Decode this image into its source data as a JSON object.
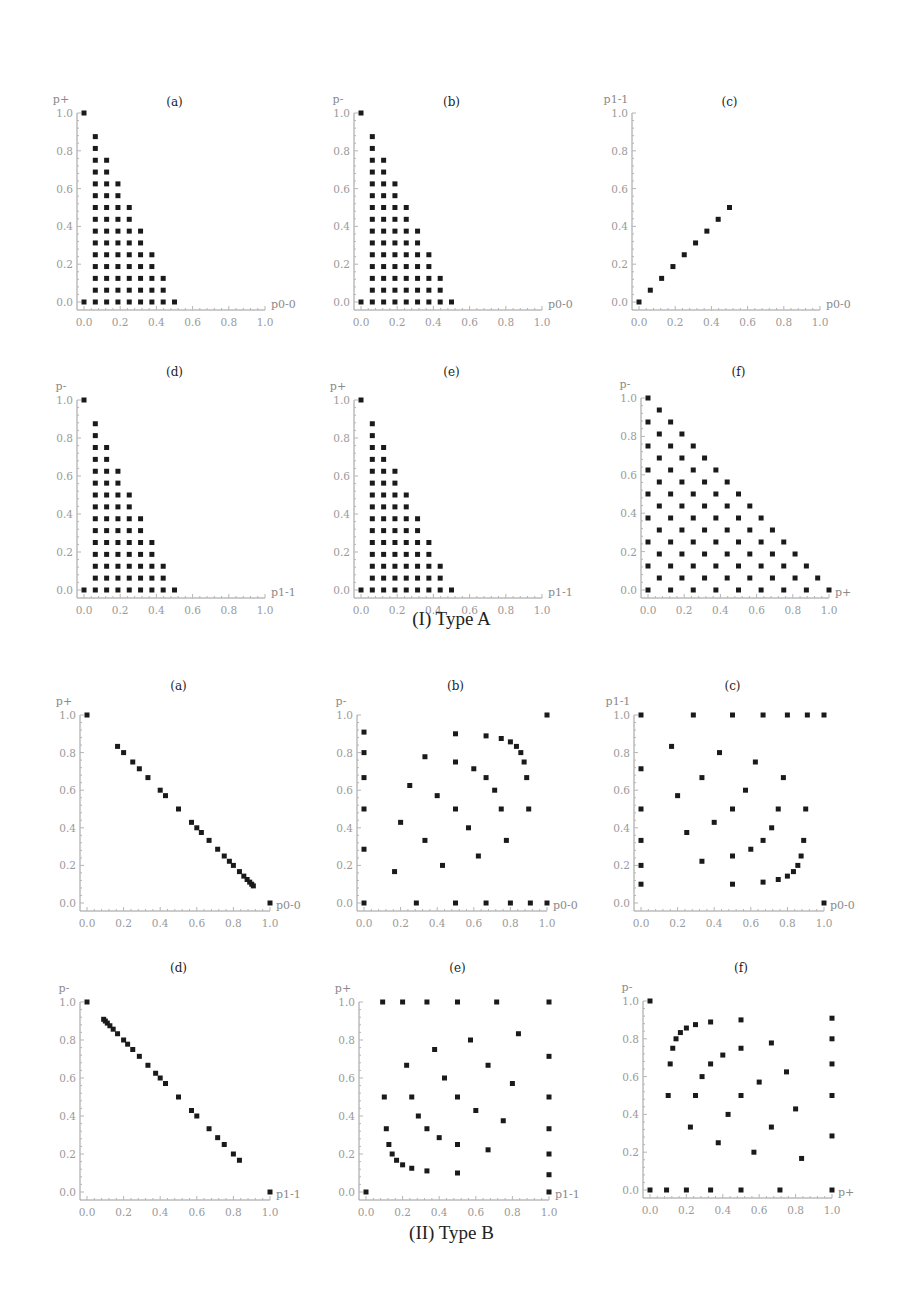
{
  "figure": {
    "captions": [
      {
        "label": "(I) Type A",
        "y": 620
      },
      {
        "label": "(II) Type B",
        "y": 1235
      }
    ]
  },
  "chart_data": [
    {
      "group": "(I) Type A",
      "panel": "(a)",
      "type": "scatter",
      "xlabel": "p0-0",
      "ylabel": "p+",
      "xlim": [
        0,
        1
      ],
      "ylim": [
        0,
        1
      ],
      "xticks": [
        "0.0",
        "0.2",
        "0.4",
        "0.6",
        "0.8",
        "1.0"
      ],
      "yticks": [
        "0.0",
        "0.2",
        "0.4",
        "0.6",
        "0.8",
        "1.0"
      ],
      "pattern": "triangle_columns",
      "description": "Points at (0,1),(0,0) and for x=k/16 (k=1..8), y=j/16 for j=0..(16-2k)",
      "layout": {
        "x0": 84,
        "x1": 265,
        "y0": 302,
        "y1": 113,
        "title_y": 106
      }
    },
    {
      "group": "(I) Type A",
      "panel": "(b)",
      "type": "scatter",
      "xlabel": "p0-0",
      "ylabel": "p-",
      "xlim": [
        0,
        1
      ],
      "ylim": [
        0,
        1
      ],
      "xticks": [
        "0.0",
        "0.2",
        "0.4",
        "0.6",
        "0.8",
        "1.0"
      ],
      "yticks": [
        "0.0",
        "0.2",
        "0.4",
        "0.6",
        "0.8",
        "1.0"
      ],
      "pattern": "triangle_columns",
      "description": "Points at (0,1),(0,0) and for x=k/16 (k=1..8), y=j/16 for j=0..(16-2k)",
      "layout": {
        "x0": 361,
        "x1": 542,
        "y0": 302,
        "y1": 113,
        "title_y": 106
      }
    },
    {
      "group": "(I) Type A",
      "panel": "(c)",
      "type": "scatter",
      "xlabel": "p0-0",
      "ylabel": "p1-1",
      "xlim": [
        0,
        1
      ],
      "ylim": [
        0,
        1
      ],
      "xticks": [
        "0.0",
        "0.2",
        "0.4",
        "0.6",
        "0.8",
        "1.0"
      ],
      "yticks": [
        "0.0",
        "0.2",
        "0.4",
        "0.6",
        "0.8",
        "1.0"
      ],
      "points": [
        [
          0,
          0
        ],
        [
          0.0625,
          0.0625
        ],
        [
          0.125,
          0.125
        ],
        [
          0.1875,
          0.1875
        ],
        [
          0.25,
          0.25
        ],
        [
          0.3125,
          0.3125
        ],
        [
          0.375,
          0.375
        ],
        [
          0.4375,
          0.4375
        ],
        [
          0.5,
          0.5
        ]
      ],
      "layout": {
        "x0": 639,
        "x1": 820,
        "y0": 302,
        "y1": 113,
        "title_y": 106
      }
    },
    {
      "group": "(I) Type A",
      "panel": "(d)",
      "type": "scatter",
      "xlabel": "p1-1",
      "ylabel": "p-",
      "xlim": [
        0,
        1
      ],
      "ylim": [
        0,
        1
      ],
      "xticks": [
        "0.0",
        "0.2",
        "0.4",
        "0.6",
        "0.8",
        "1.0"
      ],
      "yticks": [
        "0.0",
        "0.2",
        "0.4",
        "0.6",
        "0.8",
        "1.0"
      ],
      "pattern": "triangle_columns",
      "description": "Points at (0,1),(0,0) and for x=k/16 (k=1..8), y=j/16 for j=0..(16-2k)",
      "layout": {
        "x0": 84,
        "x1": 265,
        "y0": 590,
        "y1": 400,
        "title_y": 376
      }
    },
    {
      "group": "(I) Type A",
      "panel": "(e)",
      "type": "scatter",
      "xlabel": "p1-1",
      "ylabel": "p+",
      "xlim": [
        0,
        1
      ],
      "ylim": [
        0,
        1
      ],
      "xticks": [
        "0.0",
        "0.2",
        "0.4",
        "0.6",
        "0.8",
        "1.0"
      ],
      "yticks": [
        "0.0",
        "0.2",
        "0.4",
        "0.6",
        "0.8",
        "1.0"
      ],
      "pattern": "triangle_columns",
      "description": "Points at (0,1),(0,0) and for x=k/16 (k=1..8), y=j/16 for j=0..(16-2k)",
      "layout": {
        "x0": 361,
        "x1": 542,
        "y0": 590,
        "y1": 400,
        "title_y": 376
      }
    },
    {
      "group": "(I) Type A",
      "panel": "(f)",
      "type": "scatter",
      "xlabel": "p+",
      "ylabel": "p-",
      "xlim": [
        0,
        1
      ],
      "ylim": [
        0,
        1
      ],
      "xticks": [
        "0.0",
        "0.2",
        "0.4",
        "0.6",
        "0.8",
        "1.0"
      ],
      "yticks": [
        "0.0",
        "0.2",
        "0.4",
        "0.6",
        "0.8",
        "1.0"
      ],
      "pattern": "triangle_checker",
      "description": "Points (i/16, j/16) with i+j<=16 and i+j even",
      "layout": {
        "x0": 648,
        "x1": 829,
        "y0": 590,
        "y1": 398,
        "title_y": 376
      }
    },
    {
      "group": "(II) Type B",
      "panel": "(a)",
      "type": "scatter",
      "xlabel": "p0-0",
      "ylabel": "p+",
      "xlim": [
        0,
        1
      ],
      "ylim": [
        0,
        1
      ],
      "xticks": [
        "0.0",
        "0.2",
        "0.4",
        "0.6",
        "0.8",
        "1.0"
      ],
      "yticks": [
        "0.0",
        "0.2",
        "0.4",
        "0.6",
        "0.8",
        "1.0"
      ],
      "points": [
        [
          0,
          1
        ],
        [
          0.167,
          0.833
        ],
        [
          0.2,
          0.8
        ],
        [
          0.25,
          0.75
        ],
        [
          0.286,
          0.714
        ],
        [
          0.333,
          0.667
        ],
        [
          0.4,
          0.6
        ],
        [
          0.429,
          0.571
        ],
        [
          0.5,
          0.5
        ],
        [
          0.571,
          0.429
        ],
        [
          0.6,
          0.4
        ],
        [
          0.625,
          0.375
        ],
        [
          0.667,
          0.333
        ],
        [
          0.714,
          0.286
        ],
        [
          0.75,
          0.25
        ],
        [
          0.778,
          0.222
        ],
        [
          0.8,
          0.2
        ],
        [
          0.833,
          0.167
        ],
        [
          0.857,
          0.143
        ],
        [
          0.875,
          0.125
        ],
        [
          0.889,
          0.111
        ],
        [
          0.9,
          0.1
        ],
        [
          0.909,
          0.091
        ],
        [
          1,
          0
        ]
      ],
      "layout": {
        "x0": 87,
        "x1": 270,
        "y0": 903,
        "y1": 715,
        "title_y": 690
      }
    },
    {
      "group": "(II) Type B",
      "panel": "(b)",
      "type": "scatter",
      "xlabel": "p0-0",
      "ylabel": "p-",
      "xlim": [
        0,
        1
      ],
      "ylim": [
        0,
        1
      ],
      "xticks": [
        "0.0",
        "0.2",
        "0.4",
        "0.6",
        "0.8",
        "1.0"
      ],
      "yticks": [
        "0.0",
        "0.2",
        "0.4",
        "0.6",
        "0.8",
        "1.0"
      ],
      "points": [
        [
          0,
          0.909
        ],
        [
          0,
          0.8
        ],
        [
          0,
          0.667
        ],
        [
          0,
          0.5
        ],
        [
          0,
          0.286
        ],
        [
          0,
          0
        ],
        [
          0.167,
          0.167
        ],
        [
          0.2,
          0.429
        ],
        [
          0.25,
          0.625
        ],
        [
          0.286,
          0
        ],
        [
          0.333,
          0.778
        ],
        [
          0.333,
          0.333
        ],
        [
          0.4,
          0.571
        ],
        [
          0.429,
          0.2
        ],
        [
          0.5,
          0.9
        ],
        [
          0.5,
          0.75
        ],
        [
          0.5,
          0.5
        ],
        [
          0.5,
          0
        ],
        [
          0.571,
          0.4
        ],
        [
          0.6,
          0.714
        ],
        [
          0.625,
          0.25
        ],
        [
          0.667,
          0.889
        ],
        [
          0.667,
          0.667
        ],
        [
          0.667,
          0
        ],
        [
          0.714,
          0.6
        ],
        [
          0.75,
          0.875
        ],
        [
          0.75,
          0.5
        ],
        [
          0.778,
          0.333
        ],
        [
          0.8,
          0.857
        ],
        [
          0.8,
          0
        ],
        [
          0.833,
          0.833
        ],
        [
          0.857,
          0.8
        ],
        [
          0.875,
          0.75
        ],
        [
          0.889,
          0.667
        ],
        [
          0.9,
          0.5
        ],
        [
          0.909,
          0
        ],
        [
          1,
          1
        ],
        [
          1,
          0
        ]
      ],
      "layout": {
        "x0": 364,
        "x1": 547,
        "y0": 903,
        "y1": 715,
        "title_y": 690
      }
    },
    {
      "group": "(II) Type B",
      "panel": "(c)",
      "type": "scatter",
      "xlabel": "p0-0",
      "ylabel": "p1-1",
      "xlim": [
        0,
        1
      ],
      "ylim": [
        0,
        1
      ],
      "xticks": [
        "0.0",
        "0.2",
        "0.4",
        "0.6",
        "0.8",
        "1.0"
      ],
      "yticks": [
        "0.0",
        "0.2",
        "0.4",
        "0.6",
        "0.8",
        "1.0"
      ],
      "points": [
        [
          0,
          1
        ],
        [
          0,
          0.714
        ],
        [
          0,
          0.5
        ],
        [
          0,
          0.333
        ],
        [
          0,
          0.2
        ],
        [
          0,
          0.1
        ],
        [
          0.167,
          0.833
        ],
        [
          0.2,
          0.571
        ],
        [
          0.25,
          0.375
        ],
        [
          0.286,
          1
        ],
        [
          0.333,
          0.667
        ],
        [
          0.333,
          0.222
        ],
        [
          0.4,
          0.429
        ],
        [
          0.429,
          0.8
        ],
        [
          0.5,
          1
        ],
        [
          0.5,
          0.5
        ],
        [
          0.5,
          0.25
        ],
        [
          0.5,
          0.1
        ],
        [
          0.571,
          0.6
        ],
        [
          0.6,
          0.286
        ],
        [
          0.625,
          0.75
        ],
        [
          0.667,
          1
        ],
        [
          0.667,
          0.333
        ],
        [
          0.667,
          0.111
        ],
        [
          0.714,
          0.4
        ],
        [
          0.75,
          0.5
        ],
        [
          0.75,
          0.125
        ],
        [
          0.778,
          0.667
        ],
        [
          0.8,
          1
        ],
        [
          0.8,
          0.143
        ],
        [
          0.833,
          0.167
        ],
        [
          0.857,
          0.2
        ],
        [
          0.875,
          0.25
        ],
        [
          0.889,
          0.333
        ],
        [
          0.9,
          0.5
        ],
        [
          0.909,
          1
        ],
        [
          1,
          1
        ],
        [
          1,
          0
        ]
      ],
      "layout": {
        "x0": 641,
        "x1": 824,
        "y0": 903,
        "y1": 715,
        "title_y": 690
      }
    },
    {
      "group": "(II) Type B",
      "panel": "(d)",
      "type": "scatter",
      "xlabel": "p1-1",
      "ylabel": "p-",
      "xlim": [
        0,
        1
      ],
      "ylim": [
        0,
        1
      ],
      "xticks": [
        "0.0",
        "0.2",
        "0.4",
        "0.6",
        "0.8",
        "1.0"
      ],
      "yticks": [
        "0.0",
        "0.2",
        "0.4",
        "0.6",
        "0.8",
        "1.0"
      ],
      "points": [
        [
          0,
          1
        ],
        [
          0.091,
          0.909
        ],
        [
          0.1,
          0.9
        ],
        [
          0.111,
          0.889
        ],
        [
          0.125,
          0.875
        ],
        [
          0.143,
          0.857
        ],
        [
          0.167,
          0.833
        ],
        [
          0.2,
          0.8
        ],
        [
          0.222,
          0.778
        ],
        [
          0.25,
          0.75
        ],
        [
          0.286,
          0.714
        ],
        [
          0.333,
          0.667
        ],
        [
          0.375,
          0.625
        ],
        [
          0.4,
          0.6
        ],
        [
          0.429,
          0.571
        ],
        [
          0.5,
          0.5
        ],
        [
          0.571,
          0.429
        ],
        [
          0.6,
          0.4
        ],
        [
          0.667,
          0.333
        ],
        [
          0.714,
          0.286
        ],
        [
          0.75,
          0.25
        ],
        [
          0.8,
          0.2
        ],
        [
          0.833,
          0.167
        ],
        [
          1,
          0
        ]
      ],
      "layout": {
        "x0": 87,
        "x1": 270,
        "y0": 1192,
        "y1": 1002,
        "title_y": 972
      }
    },
    {
      "group": "(II) Type B",
      "panel": "(e)",
      "type": "scatter",
      "xlabel": "p1-1",
      "ylabel": "p+",
      "xlim": [
        0,
        1
      ],
      "ylim": [
        0,
        1
      ],
      "xticks": [
        "0.0",
        "0.2",
        "0.4",
        "0.6",
        "0.8",
        "1.0"
      ],
      "yticks": [
        "0.0",
        "0.2",
        "0.4",
        "0.6",
        "0.8",
        "1.0"
      ],
      "points": [
        [
          0,
          0
        ],
        [
          0.091,
          1
        ],
        [
          0.1,
          0.5
        ],
        [
          0.111,
          0.333
        ],
        [
          0.125,
          0.25
        ],
        [
          0.143,
          0.2
        ],
        [
          0.167,
          0.167
        ],
        [
          0.2,
          1
        ],
        [
          0.2,
          0.143
        ],
        [
          0.222,
          0.667
        ],
        [
          0.25,
          0.5
        ],
        [
          0.25,
          0.125
        ],
        [
          0.286,
          0.4
        ],
        [
          0.333,
          1
        ],
        [
          0.333,
          0.333
        ],
        [
          0.333,
          0.111
        ],
        [
          0.375,
          0.75
        ],
        [
          0.4,
          0.286
        ],
        [
          0.429,
          0.6
        ],
        [
          0.5,
          1
        ],
        [
          0.5,
          0.5
        ],
        [
          0.5,
          0.25
        ],
        [
          0.5,
          0.1
        ],
        [
          0.571,
          0.8
        ],
        [
          0.6,
          0.429
        ],
        [
          0.667,
          0.667
        ],
        [
          0.667,
          0.222
        ],
        [
          0.714,
          1
        ],
        [
          0.75,
          0.375
        ],
        [
          0.8,
          0.571
        ],
        [
          0.833,
          0.833
        ],
        [
          1,
          1
        ],
        [
          1,
          0.714
        ],
        [
          1,
          0.5
        ],
        [
          1,
          0.333
        ],
        [
          1,
          0.2
        ],
        [
          1,
          0.091
        ],
        [
          1,
          0
        ]
      ],
      "layout": {
        "x0": 366,
        "x1": 549,
        "y0": 1192,
        "y1": 1002,
        "title_y": 972
      }
    },
    {
      "group": "(II) Type B",
      "panel": "(f)",
      "type": "scatter",
      "xlabel": "p+",
      "ylabel": "p-",
      "xlim": [
        0,
        1
      ],
      "ylim": [
        0,
        1
      ],
      "xticks": [
        "0.0",
        "0.2",
        "0.4",
        "0.6",
        "0.8",
        "1.0"
      ],
      "yticks": [
        "0.0",
        "0.2",
        "0.4",
        "0.6",
        "0.8",
        "1.0"
      ],
      "points": [
        [
          0,
          1
        ],
        [
          0,
          0
        ],
        [
          0.091,
          0
        ],
        [
          0.1,
          0.5
        ],
        [
          0.111,
          0.667
        ],
        [
          0.125,
          0.75
        ],
        [
          0.143,
          0.8
        ],
        [
          0.167,
          0.833
        ],
        [
          0.2,
          0.857
        ],
        [
          0.2,
          0
        ],
        [
          0.222,
          0.333
        ],
        [
          0.25,
          0.875
        ],
        [
          0.25,
          0.5
        ],
        [
          0.286,
          0.6
        ],
        [
          0.333,
          0.889
        ],
        [
          0.333,
          0.667
        ],
        [
          0.333,
          0
        ],
        [
          0.375,
          0.25
        ],
        [
          0.4,
          0.714
        ],
        [
          0.429,
          0.4
        ],
        [
          0.5,
          0.9
        ],
        [
          0.5,
          0.75
        ],
        [
          0.5,
          0.5
        ],
        [
          0.5,
          0
        ],
        [
          0.571,
          0.2
        ],
        [
          0.6,
          0.571
        ],
        [
          0.667,
          0.778
        ],
        [
          0.667,
          0.333
        ],
        [
          0.714,
          0
        ],
        [
          0.75,
          0.625
        ],
        [
          0.8,
          0.429
        ],
        [
          0.833,
          0.167
        ],
        [
          1,
          0.909
        ],
        [
          1,
          0.8
        ],
        [
          1,
          0.667
        ],
        [
          1,
          0.5
        ],
        [
          1,
          0.286
        ],
        [
          1,
          0
        ]
      ],
      "layout": {
        "x0": 650,
        "x1": 832,
        "y0": 1190,
        "y1": 1001,
        "title_y": 972
      }
    }
  ]
}
